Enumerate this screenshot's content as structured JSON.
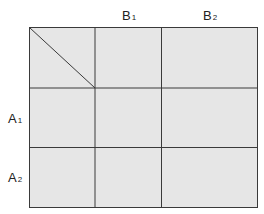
{
  "diagram": {
    "type": "two-way-table",
    "fill_color": "#e6e6e6",
    "line_color": "#3a3a3a",
    "column_headers": [
      {
        "base": "B",
        "sub": "1"
      },
      {
        "base": "B",
        "sub": "2"
      }
    ],
    "row_headers": [
      {
        "base": "A",
        "sub": "1"
      },
      {
        "base": "A",
        "sub": "2"
      }
    ],
    "corner_cell": "diagonal-split"
  }
}
